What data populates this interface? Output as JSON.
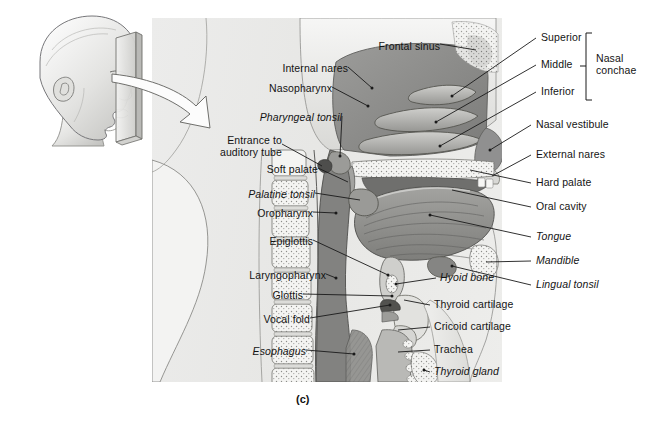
{
  "figure": {
    "caption": "(c)",
    "panel_bg": "#e9e9e7",
    "line_color": "#1a1a1a"
  },
  "inset": {
    "name": "lateral-head-with-sagittal-plane",
    "description": "Lateral view of head with mid-sagittal sectioning plane"
  },
  "arrow": {
    "name": "pointer-arrow",
    "direction": "right-down"
  },
  "labels_left": [
    {
      "text": "Internal nares",
      "italic": false,
      "x": 274,
      "y": 70,
      "lines": 1
    },
    {
      "text": "Nasopharynx",
      "italic": false,
      "x": 258,
      "y": 90,
      "lines": 1
    },
    {
      "text": "Pharyngeal tonsil",
      "italic": true,
      "x": 246,
      "y": 119,
      "lines": 1
    },
    {
      "text": "Entrance to\nauditory tube",
      "italic": false,
      "x": 214,
      "y": 142,
      "lines": 2
    },
    {
      "text": "Soft palate",
      "italic": false,
      "x": 261,
      "y": 171,
      "lines": 1
    },
    {
      "text": "Palatine tonsil",
      "italic": true,
      "x": 247,
      "y": 196,
      "lines": 1
    },
    {
      "text": "Oropharynx",
      "italic": false,
      "x": 253,
      "y": 215,
      "lines": 1
    },
    {
      "text": "Epiglottis",
      "italic": false,
      "x": 265,
      "y": 243,
      "lines": 1
    },
    {
      "text": "Laryngopharynx",
      "italic": false,
      "x": 238,
      "y": 277,
      "lines": 1
    },
    {
      "text": "Glottis",
      "italic": false,
      "x": 276,
      "y": 297,
      "lines": 1
    },
    {
      "text": "Vocal fold",
      "italic": false,
      "x": 264,
      "y": 321,
      "lines": 1
    },
    {
      "text": "Esophagus",
      "italic": true,
      "x": 254,
      "y": 353,
      "lines": 1
    }
  ],
  "labels_top": [
    {
      "text": "Frontal sinus",
      "italic": false,
      "x": 374,
      "y": 47
    }
  ],
  "labels_right": [
    {
      "text": "Superior",
      "italic": false,
      "x": 541,
      "y": 41
    },
    {
      "text": "Middle",
      "italic": false,
      "x": 541,
      "y": 68
    },
    {
      "text": "Inferior",
      "italic": false,
      "x": 541,
      "y": 95
    },
    {
      "text": "Nasal vestibule",
      "italic": false,
      "x": 536,
      "y": 128
    },
    {
      "text": "External nares",
      "italic": false,
      "x": 536,
      "y": 158
    },
    {
      "text": "Hard palate",
      "italic": false,
      "x": 536,
      "y": 186
    },
    {
      "text": "Oral cavity",
      "italic": false,
      "x": 536,
      "y": 210
    },
    {
      "text": "Tongue",
      "italic": true,
      "x": 536,
      "y": 240
    },
    {
      "text": "Mandible",
      "italic": true,
      "x": 536,
      "y": 264
    },
    {
      "text": "Lingual tonsil",
      "italic": true,
      "x": 536,
      "y": 288
    }
  ],
  "labels_bracket": {
    "text": "Nasal\nconchae",
    "x": 598,
    "y": 60,
    "members": [
      "Superior",
      "Middle",
      "Inferior"
    ]
  },
  "labels_mid": [
    {
      "text": "Hyoid bone",
      "italic": true,
      "x": 440,
      "y": 281
    },
    {
      "text": "Thyroid cartilage",
      "italic": false,
      "x": 434,
      "y": 308
    },
    {
      "text": "Cricoid cartilage",
      "italic": false,
      "x": 434,
      "y": 330
    },
    {
      "text": "Trachea",
      "italic": false,
      "x": 434,
      "y": 353
    },
    {
      "text": "Thyroid gland",
      "italic": true,
      "x": 434,
      "y": 375
    }
  ],
  "structures": [
    "frontal-sinus",
    "superior-nasal-concha",
    "middle-nasal-concha",
    "inferior-nasal-concha",
    "nasal-vestibule",
    "external-nares",
    "hard-palate",
    "oral-cavity",
    "tongue",
    "mandible",
    "lingual-tonsil",
    "soft-palate",
    "palatine-tonsil",
    "pharyngeal-tonsil",
    "nasopharynx",
    "oropharynx",
    "laryngopharynx",
    "epiglottis",
    "glottis",
    "vocal-fold",
    "hyoid-bone",
    "thyroid-cartilage",
    "cricoid-cartilage",
    "trachea",
    "thyroid-gland",
    "esophagus",
    "cervical-vertebrae"
  ]
}
